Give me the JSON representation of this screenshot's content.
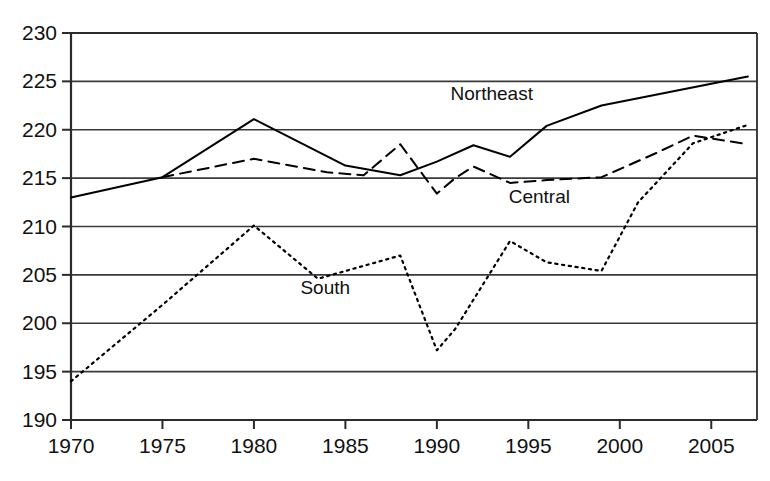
{
  "chart_data": {
    "type": "line",
    "title": "",
    "subtitle": "",
    "xlabel": "",
    "ylabel": "",
    "xlim": [
      1970,
      1007
    ],
    "ylim": [
      190,
      230
    ],
    "x_ticks": [
      1970,
      1975,
      1980,
      1985,
      1990,
      1995,
      2000,
      2005
    ],
    "y_ticks": [
      190,
      195,
      200,
      205,
      210,
      215,
      220,
      225,
      230
    ],
    "grid": "horizontal",
    "legend_position": "inline-annotations",
    "annotations": [
      {
        "text": "Northeast",
        "x": 1993.0,
        "y": 223.1
      },
      {
        "text": "Central",
        "x": 1995.6,
        "y": 212.4
      },
      {
        "text": "South",
        "x": 1983.9,
        "y": 203.0
      }
    ],
    "series": [
      {
        "name": "Northeast",
        "style": "solid",
        "x": [
          1970,
          1975,
          1980,
          1985,
          1988,
          1990,
          1992,
          1994,
          1996,
          1999,
          2007
        ],
        "values": [
          213.0,
          215.1,
          221.1,
          216.3,
          215.3,
          216.7,
          218.4,
          217.2,
          220.4,
          222.5,
          225.5
        ]
      },
      {
        "name": "Central",
        "style": "dashed",
        "x": [
          1975,
          1980,
          1984,
          1986,
          1988,
          1990,
          1991,
          1992,
          1994,
          1996,
          1999,
          2002,
          2004,
          2007
        ],
        "values": [
          215.1,
          217.0,
          215.6,
          215.3,
          218.5,
          213.4,
          215.0,
          216.2,
          214.5,
          214.8,
          215.1,
          217.6,
          219.4,
          218.5
        ]
      },
      {
        "name": "South",
        "style": "dotted",
        "x": [
          1970,
          1975,
          1980,
          1983.5,
          1988,
          1990,
          1991,
          1994,
          1996,
          1999,
          2001,
          2004,
          2007
        ],
        "values": [
          194.0,
          201.9,
          210.1,
          204.6,
          207.0,
          197.2,
          199.4,
          208.5,
          206.3,
          205.4,
          212.5,
          218.6,
          220.5
        ]
      }
    ]
  },
  "axis": {
    "y_tick_labels": [
      "230",
      "225",
      "220",
      "215",
      "210",
      "205",
      "200",
      "195",
      "190"
    ],
    "x_tick_labels": [
      "1970",
      "1975",
      "1980",
      "1985",
      "1990",
      "1995",
      "2000",
      "2005"
    ]
  }
}
